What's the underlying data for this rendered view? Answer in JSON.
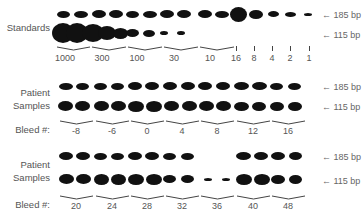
{
  "figure": {
    "markers": {
      "upper": "← 185 bp",
      "lower": "← 115 bp"
    },
    "panels": [
      {
        "id": "standards",
        "label": "Standards",
        "group_labels": [
          "1000",
          "300",
          "100",
          "30",
          "10",
          "16",
          "8",
          "4",
          "2",
          "1"
        ],
        "group_label_x": [
          65,
          102,
          137,
          174,
          210,
          236,
          254,
          272,
          290,
          309
        ],
        "brace_groups": [
          [
            57,
            90
          ],
          [
            92,
            126
          ],
          [
            128,
            162
          ],
          [
            164,
            198
          ],
          [
            200,
            234
          ]
        ],
        "single_ticks_x": [
          236,
          254,
          272,
          290,
          309
        ],
        "upper_y": 14,
        "lower_y": 33,
        "label_y": 53,
        "brace_y": 46,
        "upper_bands": [
          {
            "x": 57,
            "w": 13,
            "h": 7
          },
          {
            "x": 74,
            "w": 14,
            "h": 7
          },
          {
            "x": 92,
            "w": 14,
            "h": 8
          },
          {
            "x": 109,
            "w": 14,
            "h": 8
          },
          {
            "x": 126,
            "w": 13,
            "h": 7
          },
          {
            "x": 143,
            "w": 14,
            "h": 7
          },
          {
            "x": 160,
            "w": 14,
            "h": 8
          },
          {
            "x": 177,
            "w": 14,
            "h": 8
          },
          {
            "x": 198,
            "w": 14,
            "h": 8
          },
          {
            "x": 215,
            "w": 14,
            "h": 7
          },
          {
            "x": 230,
            "w": 17,
            "h": 15
          },
          {
            "x": 249,
            "w": 14,
            "h": 9
          },
          {
            "x": 268,
            "w": 11,
            "h": 6
          },
          {
            "x": 285,
            "w": 11,
            "h": 5
          },
          {
            "x": 304,
            "w": 8,
            "h": 3
          }
        ],
        "lower_bands": [
          {
            "x": 52,
            "w": 22,
            "h": 20
          },
          {
            "x": 66,
            "w": 22,
            "h": 20
          },
          {
            "x": 82,
            "w": 22,
            "h": 18
          },
          {
            "x": 98,
            "w": 18,
            "h": 14
          },
          {
            "x": 113,
            "w": 15,
            "h": 11
          },
          {
            "x": 126,
            "w": 13,
            "h": 8
          },
          {
            "x": 143,
            "w": 12,
            "h": 7
          },
          {
            "x": 160,
            "w": 8,
            "h": 4
          },
          {
            "x": 177,
            "w": 8,
            "h": 4
          }
        ]
      },
      {
        "id": "patient-1",
        "label": "Patient\nSamples",
        "bleed_label": "Bleed #:",
        "group_labels": [
          "-8",
          "-6",
          "0",
          "4",
          "8",
          "12",
          "16"
        ],
        "group_label_x": [
          76,
          112,
          147,
          182,
          217,
          253,
          288
        ],
        "brace_groups": [
          [
            60,
            93
          ],
          [
            96,
            129
          ],
          [
            131,
            164
          ],
          [
            166,
            199
          ],
          [
            201,
            234
          ],
          [
            237,
            270
          ],
          [
            272,
            305
          ]
        ],
        "upper_y": 86,
        "lower_y": 106,
        "label_y": 126,
        "brace_y": 120,
        "upper_bands": [
          {
            "x": 59,
            "w": 14,
            "h": 7
          },
          {
            "x": 76,
            "w": 13,
            "h": 7
          },
          {
            "x": 94,
            "w": 13,
            "h": 7
          },
          {
            "x": 111,
            "w": 13,
            "h": 7
          },
          {
            "x": 128,
            "w": 14,
            "h": 8
          },
          {
            "x": 145,
            "w": 14,
            "h": 8
          },
          {
            "x": 163,
            "w": 14,
            "h": 8
          },
          {
            "x": 181,
            "w": 14,
            "h": 8
          },
          {
            "x": 198,
            "w": 14,
            "h": 8
          },
          {
            "x": 216,
            "w": 14,
            "h": 8
          },
          {
            "x": 234,
            "w": 15,
            "h": 8
          },
          {
            "x": 252,
            "w": 15,
            "h": 8
          },
          {
            "x": 270,
            "w": 13,
            "h": 7
          },
          {
            "x": 288,
            "w": 13,
            "h": 7
          }
        ],
        "lower_bands": [
          {
            "x": 58,
            "w": 15,
            "h": 10
          },
          {
            "x": 75,
            "w": 15,
            "h": 10
          },
          {
            "x": 94,
            "w": 15,
            "h": 10
          },
          {
            "x": 111,
            "w": 15,
            "h": 10
          },
          {
            "x": 128,
            "w": 16,
            "h": 11
          },
          {
            "x": 146,
            "w": 16,
            "h": 11
          },
          {
            "x": 164,
            "w": 15,
            "h": 10
          },
          {
            "x": 182,
            "w": 15,
            "h": 10
          },
          {
            "x": 199,
            "w": 15,
            "h": 10
          },
          {
            "x": 216,
            "w": 15,
            "h": 10
          },
          {
            "x": 234,
            "w": 15,
            "h": 9
          },
          {
            "x": 252,
            "w": 14,
            "h": 9
          },
          {
            "x": 270,
            "w": 14,
            "h": 9
          },
          {
            "x": 288,
            "w": 14,
            "h": 9
          }
        ]
      },
      {
        "id": "patient-2",
        "label": "Patient\nSamples",
        "bleed_label": "Bleed #:",
        "group_labels": [
          "20",
          "24",
          "28",
          "32",
          "36",
          "40",
          "48"
        ],
        "group_label_x": [
          76,
          112,
          147,
          182,
          217,
          253,
          288
        ],
        "brace_groups": [
          [
            60,
            93
          ],
          [
            96,
            129
          ],
          [
            131,
            164
          ],
          [
            166,
            199
          ],
          [
            201,
            234
          ],
          [
            237,
            270
          ],
          [
            272,
            305
          ]
        ],
        "upper_y": 156,
        "lower_y": 179,
        "label_y": 201,
        "brace_y": 195,
        "upper_bands": [
          {
            "x": 59,
            "w": 14,
            "h": 8
          },
          {
            "x": 76,
            "w": 14,
            "h": 8
          },
          {
            "x": 94,
            "w": 13,
            "h": 7
          },
          {
            "x": 111,
            "w": 13,
            "h": 7
          },
          {
            "x": 128,
            "w": 14,
            "h": 8
          },
          {
            "x": 145,
            "w": 14,
            "h": 8
          },
          {
            "x": 163,
            "w": 13,
            "h": 7
          },
          {
            "x": 181,
            "w": 13,
            "h": 7
          },
          {
            "x": 236,
            "w": 15,
            "h": 8
          },
          {
            "x": 254,
            "w": 14,
            "h": 8
          },
          {
            "x": 271,
            "w": 14,
            "h": 8
          },
          {
            "x": 289,
            "w": 13,
            "h": 8
          }
        ],
        "lower_bands": [
          {
            "x": 59,
            "w": 15,
            "h": 10
          },
          {
            "x": 76,
            "w": 15,
            "h": 10
          },
          {
            "x": 94,
            "w": 15,
            "h": 11
          },
          {
            "x": 111,
            "w": 15,
            "h": 11
          },
          {
            "x": 128,
            "w": 16,
            "h": 11
          },
          {
            "x": 146,
            "w": 16,
            "h": 11
          },
          {
            "x": 163,
            "w": 13,
            "h": 8
          },
          {
            "x": 181,
            "w": 13,
            "h": 8
          },
          {
            "x": 204,
            "w": 8,
            "h": 3
          },
          {
            "x": 222,
            "w": 8,
            "h": 3
          },
          {
            "x": 236,
            "w": 16,
            "h": 11
          },
          {
            "x": 254,
            "w": 16,
            "h": 11
          },
          {
            "x": 271,
            "w": 14,
            "h": 9
          },
          {
            "x": 289,
            "w": 13,
            "h": 9
          }
        ]
      }
    ]
  }
}
